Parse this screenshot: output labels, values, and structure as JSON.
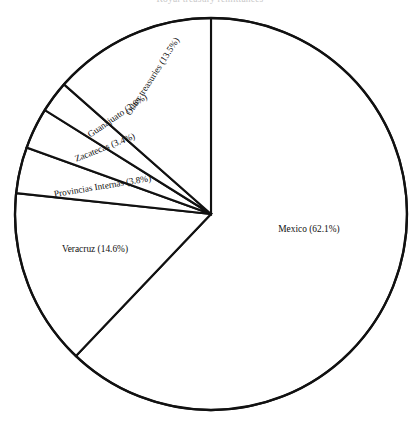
{
  "figure": {
    "clipped_title": "Royal treasury remittances",
    "background_color": "#ffffff",
    "line_color": "#111111",
    "text_color": "#111111"
  },
  "chart_data": {
    "type": "pie",
    "title": "",
    "xlabel": "",
    "ylabel": "",
    "legend_position": "none",
    "grid": false,
    "labels_inside_slices": true,
    "start_angle_deg": 90,
    "direction": "clockwise",
    "categories": [
      "Mexico",
      "Veracruz",
      "Provincias Internas",
      "Zacatecas",
      "Guanajuato",
      "Other treasuries"
    ],
    "values": [
      62.1,
      14.6,
      3.8,
      3.4,
      2.6,
      13.5
    ],
    "units": "percent",
    "slices": [
      {
        "name": "Mexico",
        "value": 62.1,
        "label": "Mexico (62.1%)",
        "label_orientation": "horizontal"
      },
      {
        "name": "Veracruz",
        "value": 14.6,
        "label": "Veracruz (14.6%)",
        "label_orientation": "horizontal"
      },
      {
        "name": "Provincias Internas",
        "value": 3.8,
        "label": "Provincias Internas (3.8%)",
        "label_orientation": "rotated"
      },
      {
        "name": "Zacatecas",
        "value": 3.4,
        "label": "Zacatecas (3.4%)",
        "label_orientation": "rotated"
      },
      {
        "name": "Guanajuato",
        "value": 2.6,
        "label": "Guanajuato (2.6%)",
        "label_orientation": "rotated"
      },
      {
        "name": "Other treasuries",
        "value": 13.5,
        "label": "Other treasuries (13.5%)",
        "label_orientation": "rotated"
      }
    ]
  }
}
